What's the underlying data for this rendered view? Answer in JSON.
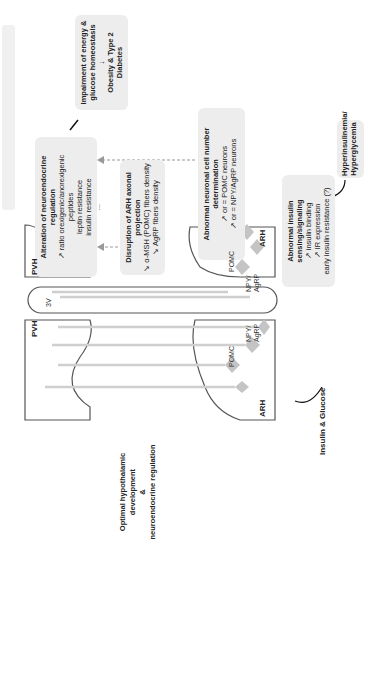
{
  "diagram": {
    "top_bar": "",
    "impairment": {
      "title_line1": "Impairment of energy &",
      "title_line2": "glucose homeostasis",
      "arrow": "↓",
      "result": "Obesity & Type 2 Diabetes"
    },
    "alteration": {
      "title": "Alteration of neuroendocrine regulation",
      "lines": [
        "↗ ratio orexigenic/anorexigenic peptides",
        "leptin resistance",
        "insulin resistance",
        "..."
      ]
    },
    "disruption": {
      "title": "Disruption of ARH axonal projection",
      "lines": [
        "↘ α-MSH (POMC) fibers density",
        "↘ AgRP fibers density"
      ]
    },
    "neuronal": {
      "title": "Abnormal neuronal cell number determination",
      "lines": [
        "↗ or = POMC neurons",
        "↗ or = NPY/AgRP neurons"
      ]
    },
    "insulin_sensing": {
      "title": "Abnormal insulin sensing/signaling",
      "lines": [
        "↗ insulin binding",
        "↗ IR expression",
        "early insulin resistance (?)"
      ]
    },
    "hyper": {
      "line1": "Hyperinsulinemia/",
      "line2": "Hyperglycemia"
    },
    "optimal": {
      "line1": "Optimal hypothalamic development",
      "line2": "&",
      "line3": "neuroendocrine regulation"
    },
    "insulin_glucose": "Insulin & Glucose",
    "regions": {
      "pvh": "PVH",
      "arh": "ARH",
      "third_ventricle": "3V",
      "pomc": "POMC",
      "npy1": "NPY/",
      "npy2": "AgRP"
    },
    "colors": {
      "box": "#ededed",
      "outline": "#555555",
      "neuron": "#c8c8c8",
      "dashed": "#999999"
    }
  }
}
